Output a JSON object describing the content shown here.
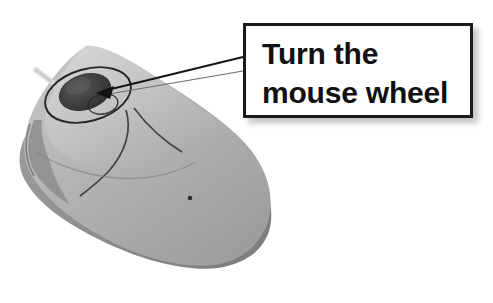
{
  "figure": {
    "kind": "annotated-photo-diagram",
    "background_color": "#ffffff"
  },
  "callout": {
    "line1": "Turn the",
    "line2": "mouse wheel",
    "text_color": "#111111",
    "border_color": "#1a1a1a",
    "fill_color": "#ffffff",
    "shadow_color": "#8a8a8a"
  },
  "leader": {
    "color": "#111111",
    "arrow_target": "mouse-wheel",
    "from_x": 243,
    "from_y": 64,
    "to_x": 100,
    "to_y": 93
  },
  "mouse": {
    "body_color_light": "#c9c9c9",
    "body_color_mid": "#b0b0b0",
    "body_color_dark": "#8e8e8e",
    "outline_color": "#2b2b2b",
    "wheel_color": "#3a3a3a",
    "cable_color": "#d8d8d8",
    "parts": [
      "cable-stub",
      "left-button",
      "right-button",
      "scroll-wheel",
      "wheel-highlight-ellipse",
      "body-seam",
      "sensor-dot"
    ]
  }
}
